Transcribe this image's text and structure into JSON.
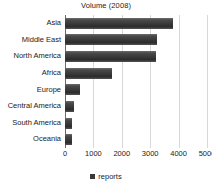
{
  "chart_data": {
    "type": "bar",
    "orientation": "horizontal",
    "title": "Volume (2008)",
    "xlabel": "",
    "ylabel": "",
    "categories": [
      "Asia",
      "Middle East",
      "North America",
      "Africa",
      "Europe",
      "Central America",
      "South America",
      "Oceania"
    ],
    "values": [
      3800,
      3250,
      3200,
      1650,
      520,
      320,
      250,
      230
    ],
    "series": [
      {
        "name": "reports",
        "values": [
          3800,
          3250,
          3200,
          1650,
          520,
          320,
          250,
          230
        ]
      }
    ],
    "xlim": [
      0,
      5000
    ],
    "xticks": [
      0,
      1000,
      2000,
      3000,
      4000,
      5000
    ],
    "xtick_labels": [
      "0",
      "1000",
      "2000",
      "3000",
      "4000",
      "5000"
    ],
    "grid": true,
    "legend": {
      "position": "bottom",
      "entries": [
        "reports"
      ]
    },
    "colors": {
      "bar_light": "#6d6d6d",
      "bar_dark": "#2c2c2c",
      "gridline": "#d8d8d8",
      "axis": "#6b6b6b",
      "text": "#1a1a1a",
      "background": "#ffffff"
    }
  }
}
